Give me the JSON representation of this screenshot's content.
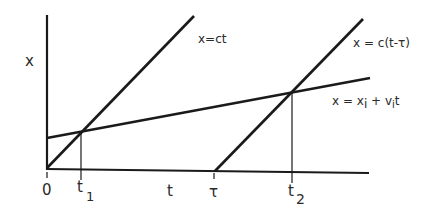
{
  "diagram": {
    "type": "spacetime-diagram",
    "axes": {
      "vertical_label": "x",
      "horizontal_label": "t",
      "origin_label": "0"
    },
    "tick_labels": {
      "t1": {
        "base": "t",
        "sub": "1"
      },
      "tau": "τ",
      "t2": {
        "base": "t",
        "sub": "2"
      }
    },
    "lines": [
      {
        "id": "light-from-origin",
        "equation": "x=ct"
      },
      {
        "id": "light-delayed",
        "equation": "x = c(t-τ)"
      },
      {
        "id": "particle-worldline",
        "equation_parts": {
          "lhs": "x = x",
          "sub1": "i",
          "mid": " + v",
          "sub2": "i",
          "rhs": "t"
        }
      }
    ],
    "colors": {
      "ink": "#1a1a1a",
      "background": "#ffffff"
    }
  }
}
